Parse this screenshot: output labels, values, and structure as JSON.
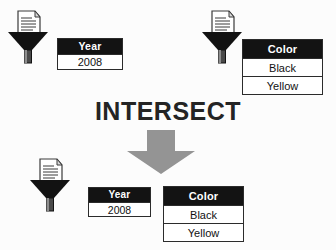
{
  "diagram": {
    "type": "set-operation-flow",
    "operator_label": "INTERSECT",
    "background_color": "#fcfcfc",
    "arrow": {
      "name": "down-arrow",
      "direction": "down",
      "color": "#949494"
    },
    "icons": {
      "funnel_top_left": "filter-funnel-icon",
      "funnel_top_right": "filter-funnel-icon",
      "funnel_bottom": "filter-funnel-icon",
      "document": "document-icon"
    },
    "colors": {
      "header_fill": "#131313",
      "header_text": "#ffffff",
      "cell_fill": "#ffffff",
      "cell_text": "#111111",
      "border": "#2b2b2b",
      "operator_text": "#242424"
    }
  },
  "inputs": [
    {
      "id": "input-left",
      "table": {
        "header": "Year",
        "rows": [
          "2008"
        ]
      }
    },
    {
      "id": "input-right",
      "table": {
        "header": "Color",
        "rows": [
          "Black",
          "Yellow"
        ]
      }
    }
  ],
  "output": {
    "id": "result",
    "tables": [
      {
        "header": "Year",
        "rows": [
          "2008"
        ]
      },
      {
        "header": "Color",
        "rows": [
          "Black",
          "Yellow"
        ]
      }
    ]
  }
}
